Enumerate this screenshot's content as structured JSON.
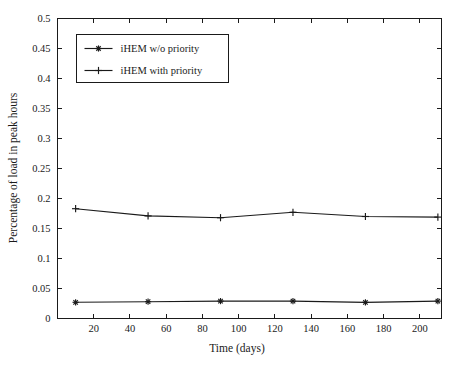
{
  "chart_data": {
    "type": "line",
    "title": "",
    "xlabel": "Time (days)",
    "ylabel": "Percentage of load in peak hours",
    "x": [
      10,
      50,
      90,
      130,
      170,
      210
    ],
    "xlim": [
      0,
      212
    ],
    "ylim": [
      0,
      0.5
    ],
    "xticks": [
      20,
      40,
      60,
      80,
      100,
      120,
      140,
      160,
      180,
      200
    ],
    "xtick_labels": [
      "20",
      "40",
      "60",
      "80",
      "100",
      "120",
      "140",
      "160",
      "180",
      "200"
    ],
    "yticks": [
      0,
      0.05,
      0.1,
      0.15,
      0.2,
      0.25,
      0.3,
      0.35,
      0.4,
      0.45,
      0.5
    ],
    "ytick_labels": [
      "0",
      "0.05",
      "0.1",
      "0.15",
      "0.2",
      "0.25",
      "0.3",
      "0.35",
      "0.4",
      "0.45",
      "0.5"
    ],
    "grid": false,
    "legend_position": "upper left",
    "series": [
      {
        "name": "iHEM w/o priority",
        "marker": "star",
        "color": "#1a1a1a",
        "values": [
          0.027,
          0.028,
          0.029,
          0.029,
          0.027,
          0.029
        ]
      },
      {
        "name": "iHEM with priority",
        "marker": "plus",
        "color": "#1a1a1a",
        "values": [
          0.183,
          0.171,
          0.168,
          0.177,
          0.17,
          0.169
        ]
      }
    ]
  },
  "legend": {
    "entries": [
      {
        "label": "iHEM w/o priority"
      },
      {
        "label": "iHEM with priority"
      }
    ]
  },
  "axes": {
    "x_title": "Time (days)",
    "y_title": "Percentage of load in peak hours"
  }
}
